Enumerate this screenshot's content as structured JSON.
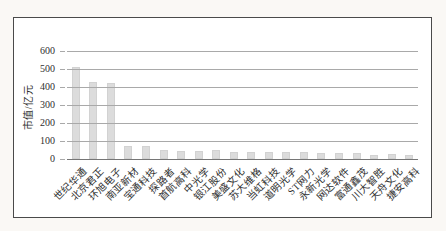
{
  "chart_data": {
    "type": "bar",
    "title": "",
    "xlabel": "",
    "ylabel": "市值/亿元",
    "ylim": [
      0,
      600
    ],
    "yticks": [
      0,
      100,
      200,
      300,
      400,
      500,
      600
    ],
    "grid": true,
    "legend": false,
    "categories": [
      "世纪华通",
      "北京君正",
      "环旭电子",
      "南亚新材",
      "宝通科技",
      "探路者",
      "首航高科",
      "中光学",
      "银江股份",
      "美盛文化",
      "苏大维格",
      "当虹科技",
      "道明光学",
      "ST网力",
      "永新光学",
      "网达软件",
      "富通鑫茂",
      "川大智胜",
      "天舟文化",
      "捷安高科"
    ],
    "values": [
      510,
      430,
      420,
      75,
      70,
      50,
      45,
      46,
      50,
      41,
      37,
      41,
      41,
      39,
      31,
      31,
      31,
      22,
      26,
      22
    ],
    "colors": {
      "bar_fill": "#dcdcdc",
      "bar_edge": "#d2d2d2",
      "gridline": "#a9a9a9",
      "axis_line": "#767676",
      "text": "#2f2f2f",
      "frame_border": "#4a4a4a",
      "chart_background": "#ffffff",
      "page_background": "#faf8f5"
    }
  }
}
